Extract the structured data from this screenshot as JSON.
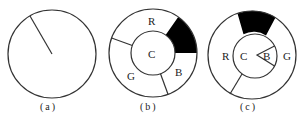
{
  "diagrams": [
    {
      "id": "a",
      "caption": "(a)",
      "center": [
        52,
        54
      ],
      "outer_radius": 44,
      "radial_lines": [
        {
          "from": [
            52,
            54
          ],
          "to": [
            30,
            16
          ]
        }
      ]
    },
    {
      "id": "b",
      "caption": "(b)",
      "center": [
        153,
        53
      ],
      "outer_radius": 44,
      "inner_radius": 22,
      "inner_label": "C",
      "ring_labels": {
        "R": "R",
        "G": "G",
        "B": "B"
      },
      "filled_sector_color": "#000000"
    },
    {
      "id": "c",
      "caption": "(c)",
      "center": [
        252,
        55
      ],
      "outer_radius": 44,
      "inner_radius": 22,
      "inner_label": "C",
      "inner_wedge_label": "B",
      "ring_labels": {
        "R": "R",
        "G": "G"
      },
      "filled_sector_color": "#000000"
    }
  ]
}
